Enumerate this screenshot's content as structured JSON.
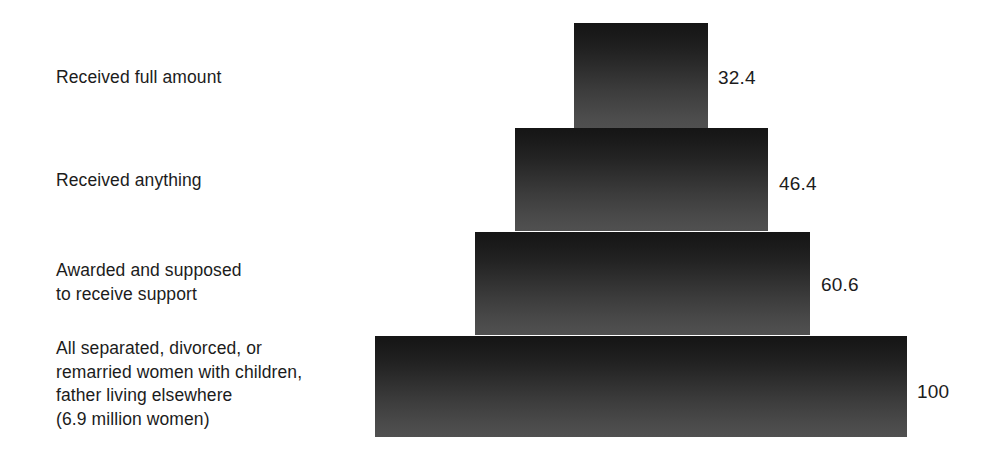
{
  "chart_data": {
    "type": "bar",
    "chart_style": "funnel",
    "title": "",
    "subtitle": "",
    "xlabel": "",
    "ylabel": "",
    "xlim": [
      0,
      100
    ],
    "grid": false,
    "legend": false,
    "orientation": "horizontal",
    "units": "percent",
    "categories": [
      "Received full amount",
      "Received anything",
      "Awarded and supposed\nto receive support",
      "All separated, divorced, or\nremarried women with children,\nfather living elsewhere\n(6.9 million women)"
    ],
    "values": [
      32.4,
      46.4,
      60.6,
      100
    ],
    "value_labels": [
      "32.4",
      "46.4",
      "60.6",
      "100"
    ],
    "annotations": [
      "6.9 million women"
    ]
  },
  "chart": {
    "background_color": "#ffffff",
    "bar_gradient_top": "#151515",
    "bar_gradient_bottom": "#505050",
    "text_color": "#1c1c1c",
    "bars": [
      {
        "id": "bar-received-full-amount",
        "label": "Received full amount",
        "value_label": "32.4",
        "left": 574,
        "top": 23,
        "width": 134,
        "height": 105,
        "label_left": 56,
        "label_top": 66,
        "value_left": 718,
        "value_top": 68
      },
      {
        "id": "bar-received-anything",
        "label": "Received anything",
        "value_label": "46.4",
        "left": 515,
        "top": 128,
        "width": 253,
        "height": 103,
        "label_left": 56,
        "label_top": 169,
        "value_left": 779,
        "value_top": 174
      },
      {
        "id": "bar-awarded-supposed-to-receive-support",
        "label": "Awarded and supposed\nto receive support",
        "value_label": "60.6",
        "left": 475,
        "top": 232,
        "width": 335,
        "height": 103,
        "label_left": 56,
        "label_top": 259,
        "value_left": 821,
        "value_top": 275
      },
      {
        "id": "bar-all-separated-divorced-remarried",
        "label": "All separated, divorced, or\nremarried women with children,\nfather living elsewhere\n(6.9 million women)",
        "value_label": "100",
        "left": 375,
        "top": 336,
        "width": 532,
        "height": 101,
        "label_left": 56,
        "label_top": 337,
        "value_left": 917,
        "value_top": 382
      }
    ]
  }
}
